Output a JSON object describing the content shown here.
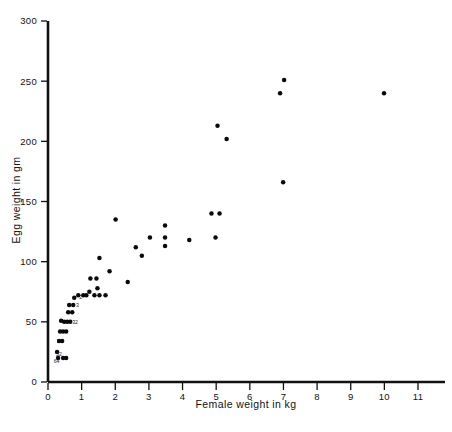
{
  "chart_data": {
    "type": "scatter",
    "title": "",
    "xlabel": "Female weight in kg",
    "ylabel": "Egg weight in gm",
    "xlim": [
      0,
      11.6
    ],
    "ylim": [
      0,
      300
    ],
    "xticks": [
      0,
      1,
      2,
      3,
      4,
      5,
      6,
      7,
      8,
      9,
      10,
      11
    ],
    "xtick_labels": [
      "0",
      "1",
      "2",
      "3",
      "4",
      "5",
      "6",
      "7",
      "8",
      "9",
      "10",
      "11"
    ],
    "yticks": [
      0,
      50,
      100,
      150,
      200,
      250,
      300
    ],
    "ytick_labels": [
      "0",
      "50",
      "100",
      "150",
      "200",
      "250",
      "300"
    ],
    "grid": false,
    "legend": null,
    "marker": "filled-circle",
    "marker_color": "#0a0a0a",
    "points": [
      {
        "x": 0.27,
        "y": 25
      },
      {
        "x": 0.33,
        "y": 34
      },
      {
        "x": 0.42,
        "y": 34
      },
      {
        "x": 0.36,
        "y": 42
      },
      {
        "x": 0.45,
        "y": 42
      },
      {
        "x": 0.54,
        "y": 42
      },
      {
        "x": 0.3,
        "y": 20
      },
      {
        "x": 0.45,
        "y": 20
      },
      {
        "x": 0.54,
        "y": 20
      },
      {
        "x": 0.48,
        "y": 50
      },
      {
        "x": 0.57,
        "y": 50
      },
      {
        "x": 0.66,
        "y": 50
      },
      {
        "x": 0.39,
        "y": 51
      },
      {
        "x": 0.6,
        "y": 58
      },
      {
        "x": 0.72,
        "y": 58
      },
      {
        "x": 0.63,
        "y": 64
      },
      {
        "x": 0.75,
        "y": 64
      },
      {
        "x": 0.78,
        "y": 70
      },
      {
        "x": 0.9,
        "y": 72
      },
      {
        "x": 1.05,
        "y": 72
      },
      {
        "x": 1.14,
        "y": 72
      },
      {
        "x": 1.23,
        "y": 75
      },
      {
        "x": 1.38,
        "y": 72
      },
      {
        "x": 1.53,
        "y": 72
      },
      {
        "x": 1.71,
        "y": 72
      },
      {
        "x": 1.26,
        "y": 86
      },
      {
        "x": 1.44,
        "y": 86
      },
      {
        "x": 1.47,
        "y": 78
      },
      {
        "x": 1.53,
        "y": 103
      },
      {
        "x": 1.83,
        "y": 92
      },
      {
        "x": 2.01,
        "y": 135
      },
      {
        "x": 2.37,
        "y": 83
      },
      {
        "x": 2.61,
        "y": 112
      },
      {
        "x": 2.79,
        "y": 105
      },
      {
        "x": 3.03,
        "y": 120
      },
      {
        "x": 3.48,
        "y": 130
      },
      {
        "x": 3.48,
        "y": 120
      },
      {
        "x": 3.48,
        "y": 113
      },
      {
        "x": 4.2,
        "y": 118
      },
      {
        "x": 4.86,
        "y": 140
      },
      {
        "x": 5.1,
        "y": 140
      },
      {
        "x": 4.98,
        "y": 120
      },
      {
        "x": 5.04,
        "y": 213
      },
      {
        "x": 5.31,
        "y": 202
      },
      {
        "x": 6.9,
        "y": 240
      },
      {
        "x": 7.02,
        "y": 251
      },
      {
        "x": 6.99,
        "y": 166
      },
      {
        "x": 9.99,
        "y": 240
      }
    ],
    "cluster_annotations": [
      {
        "x": 0.17,
        "y": 16,
        "label": "64"
      },
      {
        "x": 0.24,
        "y": 22,
        "label": "52"
      },
      {
        "x": 0.26,
        "y": 32,
        "label": "2"
      },
      {
        "x": 0.72,
        "y": 48,
        "label": "32"
      },
      {
        "x": 0.83,
        "y": 62,
        "label": "3"
      },
      {
        "x": 0.93,
        "y": 69,
        "label": "2"
      }
    ]
  },
  "figure": {
    "background_color": "#ffffff",
    "axis_color": "#111111"
  }
}
